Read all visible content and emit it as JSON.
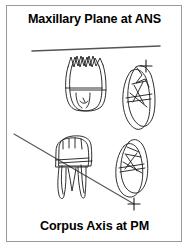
{
  "figure": {
    "title": "Maxillary Plane at ANS",
    "bottom_label": "Corpus Axis at PM",
    "border_color": "#9a9a9a",
    "background_color": "#ffffff",
    "ink_color": "#1a1a1a",
    "plane_line_color": "#555555"
  },
  "reference_lines": [
    {
      "name": "maxillary-plane-line",
      "label": "Maxillary Plane at ANS",
      "x1": 26,
      "y1": 46,
      "x2": 154,
      "y2": 41
    },
    {
      "name": "corpus-axis-line",
      "label": "Corpus Axis at PM",
      "x1": 8,
      "y1": 129,
      "x2": 128,
      "y2": 199
    }
  ],
  "registration_markers": [
    {
      "name": "ans-marker",
      "x": 140,
      "y": 61,
      "glyph": "+"
    },
    {
      "name": "pm-marker",
      "x": 128,
      "y": 199,
      "glyph": "+"
    }
  ],
  "tooth_tracings": [
    {
      "name": "maxillary-molar-frontal",
      "position": "upper-left",
      "view": "frontal",
      "cusps": 4,
      "roots": 2
    },
    {
      "name": "maxillary-molar-proximal",
      "position": "upper-right",
      "view": "proximal-tilted",
      "cusps": 2,
      "roots": 1
    },
    {
      "name": "mandibular-molar-frontal",
      "position": "lower-left",
      "view": "frontal",
      "cusps": 4,
      "roots": 2
    },
    {
      "name": "mandibular-molar-proximal",
      "position": "lower-right",
      "view": "proximal-tilted",
      "cusps": 2,
      "roots": 1
    }
  ]
}
